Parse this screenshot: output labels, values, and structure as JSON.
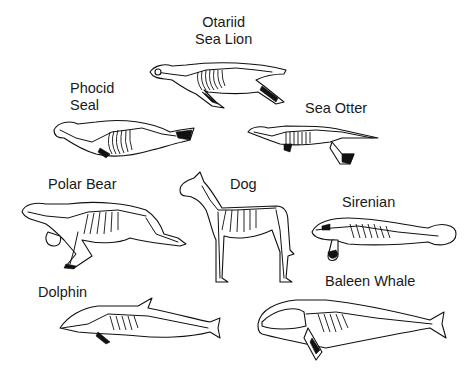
{
  "diagram": {
    "type": "comparative-anatomy-illustration",
    "style": "black line-art skeletons inside body outlines",
    "background_color": "#ffffff",
    "ink_color": "#111111",
    "animals": [
      {
        "id": "otariid",
        "label_line1": "Otariid",
        "label_line2": "Sea Lion"
      },
      {
        "id": "phocid",
        "label_line1": "Phocid",
        "label_line2": "Seal"
      },
      {
        "id": "sea_otter",
        "label": "Sea Otter"
      },
      {
        "id": "polar_bear",
        "label": "Polar Bear"
      },
      {
        "id": "dog",
        "label": "Dog"
      },
      {
        "id": "sirenian",
        "label": "Sirenian"
      },
      {
        "id": "dolphin",
        "label": "Dolphin"
      },
      {
        "id": "baleen_whale",
        "label": "Baleen Whale"
      }
    ]
  }
}
